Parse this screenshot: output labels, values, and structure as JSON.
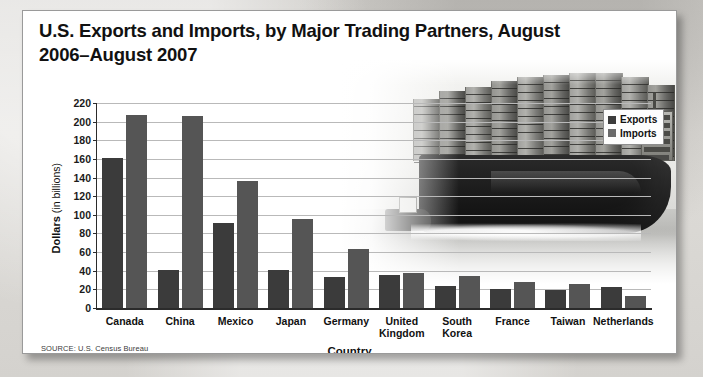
{
  "title": "U.S. Exports and Imports, by Major Trading\nPartners, August 2006–August 2007",
  "source": "SOURCE: U.S. Census Bureau",
  "legend": {
    "exports_label": "Exports",
    "imports_label": "Imports"
  },
  "axes": {
    "ylabel_bold": "Dollars",
    "ylabel_rest": " (in billions)",
    "xlabel": "Country"
  },
  "colors": {
    "exports": "#3b3b3b",
    "imports": "#555555",
    "axis": "#2b2b2b",
    "grid": "#b9b9b9",
    "card_bg": "#ffffff",
    "page_bg": "#d8d6d2"
  },
  "chart_data": {
    "type": "bar",
    "title": "U.S. Exports and Imports, by Major Trading Partners, August 2006–August 2007",
    "xlabel": "Country",
    "ylabel": "Dollars (in billions)",
    "ylim": [
      0,
      220
    ],
    "yticks": [
      0,
      20,
      40,
      60,
      80,
      100,
      120,
      140,
      160,
      180,
      200,
      220
    ],
    "ytick_labels": [
      "0",
      "20",
      "40",
      "60",
      "80",
      "100",
      "120",
      "140",
      "160",
      "180",
      "200",
      "220"
    ],
    "grid": true,
    "legend_position": "top-right",
    "categories": [
      "Canada",
      "China",
      "Mexico",
      "Japan",
      "Germany",
      "United Kingdom",
      "South Korea",
      "France",
      "Taiwan",
      "Netherlands"
    ],
    "category_lines": [
      [
        "Canada"
      ],
      [
        "China"
      ],
      [
        "Mexico"
      ],
      [
        "Japan"
      ],
      [
        "Germany"
      ],
      [
        "United",
        "Kingdom"
      ],
      [
        "South",
        "Korea"
      ],
      [
        "France"
      ],
      [
        "Taiwan"
      ],
      [
        "Netherlands"
      ]
    ],
    "series": [
      {
        "name": "Exports",
        "color": "#3b3b3b",
        "values": [
          161,
          41,
          91,
          41,
          33,
          35,
          24,
          20,
          19,
          23
        ]
      },
      {
        "name": "Imports",
        "color": "#555555",
        "values": [
          207,
          206,
          136,
          96,
          63,
          38,
          34,
          28,
          26,
          13
        ]
      }
    ],
    "source": "SOURCE: U.S. Census Bureau"
  }
}
